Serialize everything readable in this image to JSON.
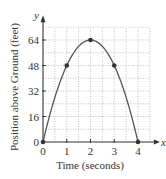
{
  "chart_data": {
    "type": "line",
    "title": "",
    "xlabel": "Time (seconds)",
    "ylabel": "Position above Ground (feet)",
    "x_axis_var": "x",
    "y_axis_var": "y",
    "xlim": [
      0,
      4.5
    ],
    "ylim": [
      0,
      72
    ],
    "x_ticks": [
      0,
      1,
      2,
      3,
      4
    ],
    "y_ticks": [
      0,
      16,
      32,
      48,
      64
    ],
    "grid": true,
    "grid_style": "dotted",
    "grid_step_x": 0.5,
    "grid_step_y": 8,
    "series": [
      {
        "name": "s(t) = -16t^2 + 64t",
        "style": "smooth curve",
        "x": [
          0,
          1,
          2,
          3,
          4
        ],
        "y": [
          0,
          48,
          64,
          48,
          0
        ],
        "markers": true
      }
    ],
    "colors": {
      "curve": "#555555",
      "axis": "#333333",
      "grid": "#9a9a9a",
      "marker": "#333333"
    }
  }
}
